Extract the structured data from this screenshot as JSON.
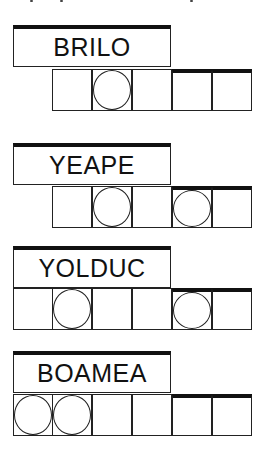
{
  "puzzles": [
    {
      "scrambled": "BRILO",
      "cells": 5,
      "circled": [
        2
      ]
    },
    {
      "scrambled": "YEAPE",
      "cells": 5,
      "circled": [
        2,
        4
      ]
    },
    {
      "scrambled": "YOLDUC",
      "cells": 6,
      "circled": [
        2,
        5
      ]
    },
    {
      "scrambled": "BOAMEA",
      "cells": 6,
      "circled": [
        1,
        2
      ]
    }
  ]
}
